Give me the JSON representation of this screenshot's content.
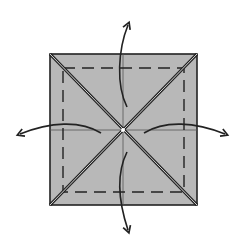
{
  "diagram": {
    "type": "origami-fold-diagram",
    "colors": {
      "paper": "#b8b8b8",
      "line": "#222222",
      "crease_highlight": "#ffffff",
      "background": "#ffffff"
    },
    "square": {
      "x": 50,
      "y": 54,
      "size": 147
    },
    "dashed_inner": {
      "x": 63,
      "y": 68,
      "w": 121,
      "h": 124
    },
    "center": {
      "x": 123,
      "y": 130
    },
    "arrows": [
      {
        "name": "arrow-up",
        "direction": "up"
      },
      {
        "name": "arrow-left",
        "direction": "left"
      },
      {
        "name": "arrow-right",
        "direction": "right"
      },
      {
        "name": "arrow-down",
        "direction": "down"
      }
    ]
  }
}
